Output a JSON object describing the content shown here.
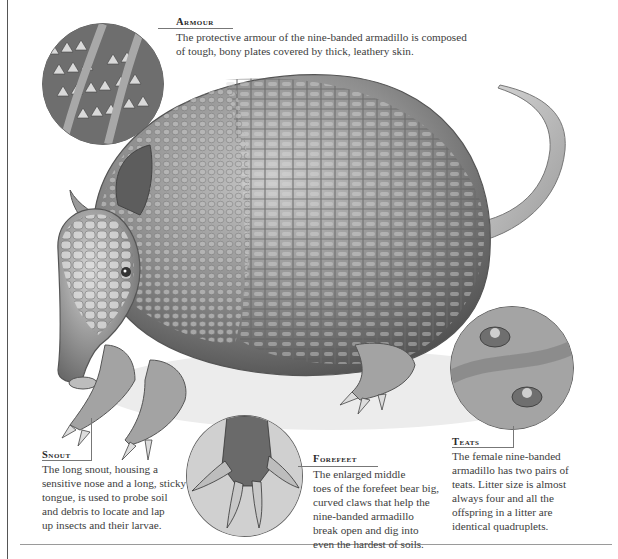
{
  "top_fragment": "y                              p  g",
  "illustration": {
    "subject": "nine-banded armadillo",
    "icon": "armadillo-illustration",
    "colors": {
      "ink": "#3a3a3a",
      "shell_mid": "#9a9a9a",
      "shell_dark": "#5e5e5e",
      "ground": "#e6e6e6"
    }
  },
  "callouts": {
    "armour": {
      "heading": "Armour",
      "text": "The protective armour of the nine-banded armadillo is composed of tough, bony plates covered by thick, leathery skin.",
      "lines": [
        "The protective armour of the nine-banded armadillo is composed",
        "of tough, bony plates covered by thick, leathery skin."
      ]
    },
    "snout": {
      "heading": "Snout",
      "lines": [
        "The long snout, housing a",
        "sensitive nose and a long, sticky",
        "tongue, is used to probe soil",
        "and debris to locate and lap",
        "up insects and their larvae."
      ]
    },
    "forefeet": {
      "heading": "Forefeet",
      "lines": [
        "The enlarged middle",
        "toes of the forefeet bear big,",
        "curved claws that help the",
        "nine-banded armadillo",
        "break open and dig into",
        "even the hardest of soils."
      ]
    },
    "teats": {
      "heading": "Teats",
      "lines": [
        "The female nine-banded",
        "armadillo has two pairs of",
        "teats. Litter size is almost",
        "always four and all the",
        "offspring in a litter are",
        "identical quadruplets."
      ]
    }
  }
}
